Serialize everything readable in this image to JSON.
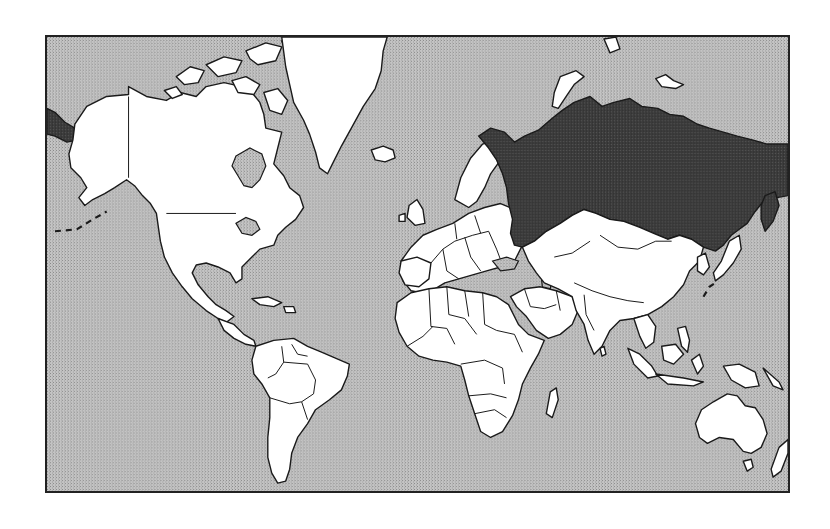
{
  "map": {
    "type": "world-political-outline",
    "projection": "mercator",
    "highlighted_region": "Russia",
    "colors": {
      "ocean": "#b4b4b4",
      "land": "#ffffff",
      "highlight": "#3a3a3a",
      "outline": "#1a1a1a",
      "frame": "#222222"
    },
    "regions": [
      {
        "name": "North America",
        "highlighted": false
      },
      {
        "name": "Greenland",
        "highlighted": false
      },
      {
        "name": "South America",
        "highlighted": false
      },
      {
        "name": "Europe",
        "highlighted": false
      },
      {
        "name": "Africa",
        "highlighted": false
      },
      {
        "name": "Russia",
        "highlighted": true
      },
      {
        "name": "Asia",
        "highlighted": false
      },
      {
        "name": "Australia",
        "highlighted": false
      },
      {
        "name": "Oceania",
        "highlighted": false
      }
    ]
  }
}
